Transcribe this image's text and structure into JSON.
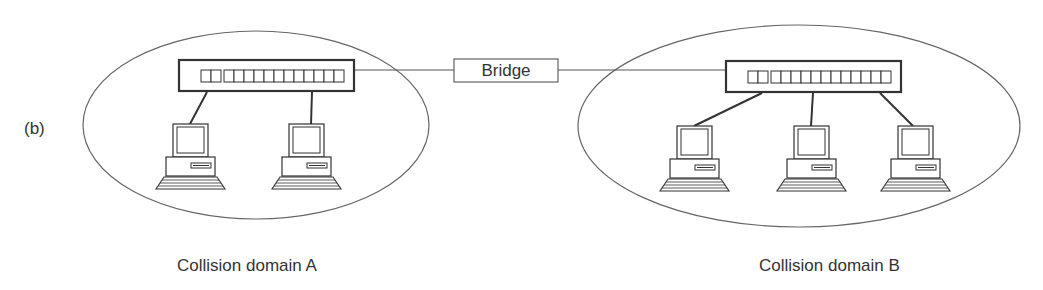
{
  "figure": {
    "part_label": "(b)",
    "bridge": {
      "label": "Bridge"
    },
    "domains": [
      {
        "label": "Collision domain A",
        "hub_ports": 14,
        "computers": 2
      },
      {
        "label": "Collision domain B",
        "hub_ports": 14,
        "computers": 3
      }
    ],
    "colors": {
      "line": "#333333",
      "ellipse": "#666666",
      "background": "#ffffff"
    }
  }
}
